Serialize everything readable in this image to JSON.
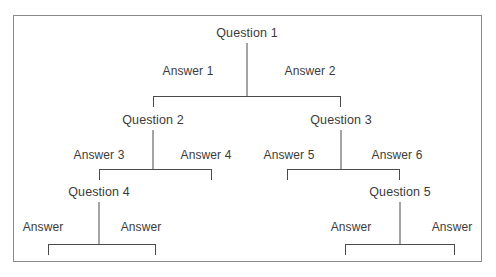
{
  "diagram": {
    "type": "decision-tree",
    "title_fragment": "",
    "frame": {
      "x": 13,
      "y": 15,
      "width": 469,
      "height": 247
    },
    "nodes": [
      {
        "id": "q1",
        "label": "Question 1",
        "x": 247,
        "y": 26,
        "level": 0
      },
      {
        "id": "q2",
        "label": "Question 2",
        "x": 153,
        "y": 113,
        "level": 1
      },
      {
        "id": "q3",
        "label": "Question 3",
        "x": 341,
        "y": 113,
        "level": 1
      },
      {
        "id": "q4",
        "label": "Question 4",
        "x": 99,
        "y": 185,
        "level": 2
      },
      {
        "id": "q5",
        "label": "Question 5",
        "x": 400,
        "y": 185,
        "level": 2
      }
    ],
    "edge_labels": [
      {
        "id": "a1",
        "label": "Answer 1",
        "x": 188,
        "y": 64
      },
      {
        "id": "a2",
        "label": "Answer 2",
        "x": 310,
        "y": 64
      },
      {
        "id": "a3",
        "label": "Answer 3",
        "x": 99,
        "y": 148
      },
      {
        "id": "a4",
        "label": "Answer 4",
        "x": 206,
        "y": 148
      },
      {
        "id": "a5",
        "label": "Answer 5",
        "x": 289,
        "y": 148
      },
      {
        "id": "a6",
        "label": "Answer 6",
        "x": 397,
        "y": 148
      },
      {
        "id": "a7",
        "label": "Answer",
        "x": 43,
        "y": 220
      },
      {
        "id": "a8",
        "label": "Answer",
        "x": 141,
        "y": 220
      },
      {
        "id": "a9",
        "label": "Answer",
        "x": 351,
        "y": 220
      },
      {
        "id": "a10",
        "label": "Answer",
        "x": 452,
        "y": 220
      }
    ],
    "stems": [
      {
        "id": "stem-q1",
        "x": 247,
        "y": 43,
        "height": 53
      },
      {
        "id": "stem-q2",
        "x": 153,
        "y": 130,
        "height": 39
      },
      {
        "id": "stem-q3",
        "x": 341,
        "y": 130,
        "height": 39
      },
      {
        "id": "stem-q4",
        "x": 99,
        "y": 202,
        "height": 42
      },
      {
        "id": "stem-q5",
        "x": 400,
        "y": 202,
        "height": 42
      }
    ],
    "brackets": [
      {
        "id": "bracket-q1",
        "left": 153,
        "right": 341,
        "y": 96,
        "depth": 11
      },
      {
        "id": "bracket-q2",
        "left": 99,
        "right": 212,
        "y": 169,
        "depth": 11
      },
      {
        "id": "bracket-q3",
        "left": 287,
        "right": 400,
        "y": 169,
        "depth": 11
      },
      {
        "id": "bracket-q4",
        "left": 48,
        "right": 156,
        "y": 244,
        "depth": 11
      },
      {
        "id": "bracket-q5",
        "left": 345,
        "right": 455,
        "y": 244,
        "depth": 11
      }
    ],
    "colors": {
      "line": "#4a4a4a",
      "frame": "#8a8a8a",
      "text": "#3b3b3b",
      "background": "#ffffff"
    }
  }
}
